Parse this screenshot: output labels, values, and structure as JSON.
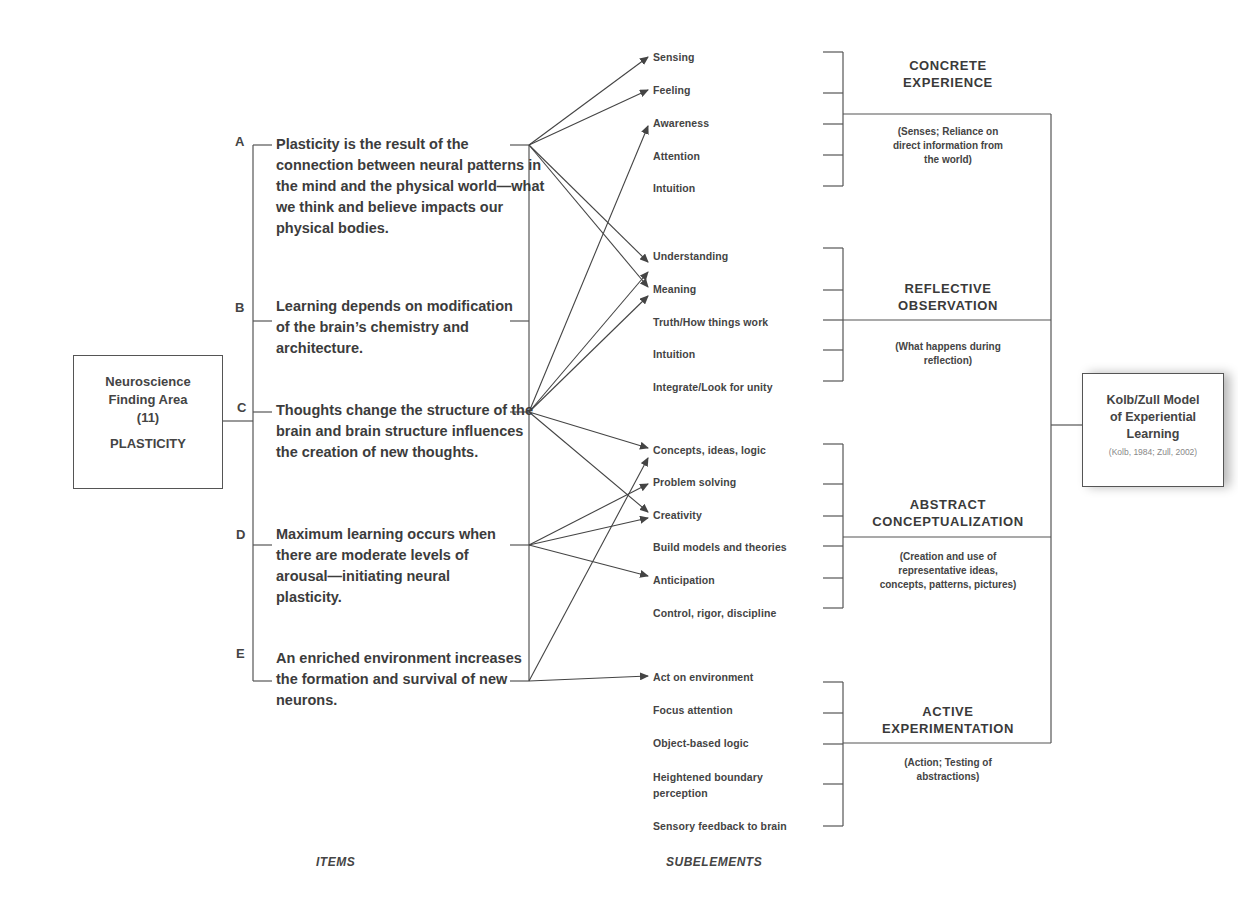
{
  "root": {
    "line1": "Neuroscience",
    "line2": "Finding Area",
    "line3": "(11)",
    "line4": "PLASTICITY"
  },
  "items": [
    {
      "letter": "A",
      "text": "Plasticity is the result of the connection between neural patterns in the mind and the physical world—what we think and believe impacts our physical bodies."
    },
    {
      "letter": "B",
      "text": "Learning depends on modification of the brain’s chemistry and architecture."
    },
    {
      "letter": "C",
      "text": "Thoughts change the structure of the brain and brain structure influences the creation of new thoughts."
    },
    {
      "letter": "D",
      "text": "Maximum learning occurs when there are moderate levels of arousal—initiating neural plasticity."
    },
    {
      "letter": "E",
      "text": "An enriched environment increases the formation and survival of new neurons."
    }
  ],
  "subelements": {
    "concrete": [
      "Sensing",
      "Feeling",
      "Awareness",
      "Attention",
      "Intuition"
    ],
    "reflective": [
      "Understanding",
      "Meaning",
      "Truth/How things work",
      "Intuition",
      "Integrate/Look for unity"
    ],
    "abstract": [
      "Concepts, ideas, logic",
      "Problem solving",
      "Creativity",
      "Build models and theories",
      "Anticipation",
      "Control, rigor, discipline"
    ],
    "active": [
      "Act on environment",
      "Focus attention",
      "Object-based logic",
      "Heightened boundary perception",
      "Sensory feedback to brain"
    ]
  },
  "modes": [
    {
      "title1": "CONCRETE",
      "title2": "EXPERIENCE",
      "desc": [
        "(Senses; Reliance on",
        "direct information from",
        "the world)"
      ]
    },
    {
      "title1": "REFLECTIVE",
      "title2": "OBSERVATION",
      "desc": [
        "(What happens during",
        "reflection)"
      ]
    },
    {
      "title1": "ABSTRACT",
      "title2": "CONCEPTUALIZATION",
      "desc": [
        "(Creation and use of",
        "representative ideas,",
        "concepts, patterns, pictures)"
      ]
    },
    {
      "title1": "ACTIVE",
      "title2": "EXPERIMENTATION",
      "desc": [
        "(Action; Testing of",
        "abstractions)"
      ]
    }
  ],
  "model": {
    "line1": "Kolb/Zull Model",
    "line2": "of Experiential",
    "line3": "Learning",
    "citation": "(Kolb, 1984; Zull, 2002)"
  },
  "axis_labels": {
    "items": "ITEMS",
    "subelements": "SUBELEMENTS"
  },
  "connections": [
    {
      "from": "A",
      "to": [
        "Sensing",
        "Feeling",
        "Understanding",
        "Meaning"
      ]
    },
    {
      "from": "B",
      "to": []
    },
    {
      "from": "C",
      "to": [
        "Awareness",
        "Understanding",
        "Meaning",
        "Concepts, ideas, logic",
        "Creativity"
      ]
    },
    {
      "from": "D",
      "to": [
        "Problem solving",
        "Creativity",
        "Anticipation"
      ]
    },
    {
      "from": "E",
      "to": [
        "Concepts, ideas, logic",
        "Act on environment"
      ]
    }
  ],
  "colors": {
    "line": "#555555",
    "text": "#3c3c3c"
  }
}
